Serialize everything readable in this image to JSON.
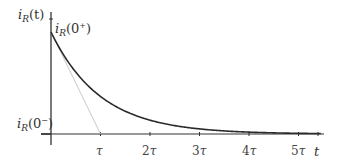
{
  "chart_data": {
    "type": "line",
    "title": "",
    "xlabel": "t",
    "ylabel": "i_R(t)",
    "x_ticks": [
      "τ",
      "2τ",
      "3τ",
      "4τ",
      "5τ"
    ],
    "x_tick_values": [
      1,
      2,
      3,
      4,
      5
    ],
    "xlim": [
      0,
      5.5
    ],
    "ylim": [
      0,
      1.15
    ],
    "grid": false,
    "legend": null,
    "annotations": [
      {
        "text": "i_R(0+)",
        "position": "initial value at t=0+"
      },
      {
        "text": "i_R(0-)",
        "position": "value at t=0- (baseline 0)"
      }
    ],
    "series": [
      {
        "name": "i_R(t)",
        "style": "solid dark",
        "x": [
          0,
          0.5,
          1,
          1.5,
          2,
          2.5,
          3,
          3.5,
          4,
          4.5,
          5,
          5.4
        ],
        "values": [
          1.0,
          0.607,
          0.368,
          0.223,
          0.135,
          0.082,
          0.05,
          0.03,
          0.018,
          0.011,
          0.007,
          0.005
        ]
      },
      {
        "name": "initial tangent",
        "style": "light gray",
        "x": [
          0,
          1
        ],
        "values": [
          1.0,
          0.0
        ]
      }
    ]
  },
  "labels": {
    "y_axis": {
      "base": "i",
      "sub": "R",
      "arg": "(t)"
    },
    "initial_plus": {
      "base": "i",
      "sub": "R",
      "arg_open": "(0",
      "sup": "+",
      "arg_close": ")"
    },
    "initial_minus": {
      "base": "i",
      "sub": "R",
      "arg_open": "(0",
      "sup": "−",
      "arg_close": ")"
    },
    "x_axis": "t",
    "ticks": [
      {
        "num": "",
        "tau": "τ"
      },
      {
        "num": "2",
        "tau": "τ"
      },
      {
        "num": "3",
        "tau": "τ"
      },
      {
        "num": "4",
        "tau": "τ"
      },
      {
        "num": "5",
        "tau": "τ"
      }
    ]
  },
  "colors": {
    "curve": "#2a2a2a",
    "tangent": "#c8c8c8",
    "axis": "#333333"
  }
}
